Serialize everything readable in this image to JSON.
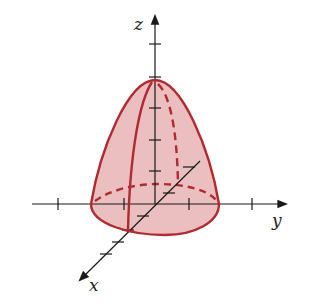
{
  "figure": {
    "axes": {
      "x": {
        "label": "x"
      },
      "y": {
        "label": "y"
      },
      "z": {
        "label": "z"
      }
    },
    "colors": {
      "surface_stroke": "#b02a30",
      "surface_fill": "#e8b4b4",
      "axis": "#1a1a1a",
      "background": "#ffffff"
    }
  }
}
